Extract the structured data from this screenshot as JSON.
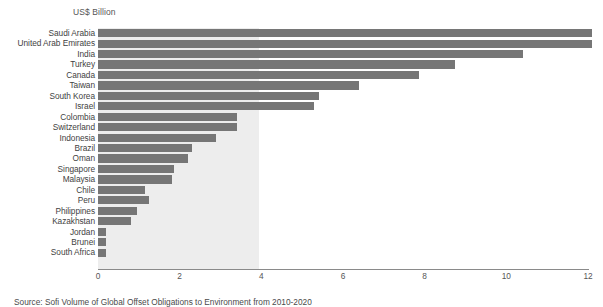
{
  "chart_data": {
    "type": "bar",
    "orientation": "horizontal",
    "title": "",
    "unit_label": "US$ Billion",
    "xlabel": "",
    "ylabel": "",
    "xlim": [
      0,
      12
    ],
    "xticks": [
      "0",
      "2",
      "4",
      "6",
      "8",
      "10",
      "12"
    ],
    "xtick_values": [
      0,
      2,
      4,
      6,
      8,
      10,
      12
    ],
    "grid": false,
    "legend": null,
    "shaded_region": {
      "from": 0,
      "to": 3.95,
      "color": "#ededed"
    },
    "bar_color": "#767676",
    "categories": [
      "Saudi Arabia",
      "United Arab Emirates",
      "India",
      "Turkey",
      "Canada",
      "Taiwan",
      "South Korea",
      "Israel",
      "Colombia",
      "Switzerland",
      "Indonesia",
      "Brazil",
      "Oman",
      "Singapore",
      "Malaysia",
      "Chile",
      "Peru",
      "Philippines",
      "Kazakhstan",
      "Jordan",
      "Brunei",
      "South Africa"
    ],
    "values": [
      12.1,
      12.1,
      10.4,
      8.75,
      7.85,
      6.4,
      5.4,
      5.3,
      3.4,
      3.4,
      2.9,
      2.3,
      2.2,
      1.85,
      1.8,
      1.15,
      1.25,
      0.95,
      0.8,
      0.2,
      0.2,
      0.2
    ]
  },
  "caption": {
    "text": "Source: Sofi Volume of Global Offset Obligations to Environment from 2010-2020"
  },
  "colors": {
    "bar": "#767676",
    "shade": "#ededed",
    "axis": "#8a8a8a",
    "text": "#3f3f3f"
  }
}
